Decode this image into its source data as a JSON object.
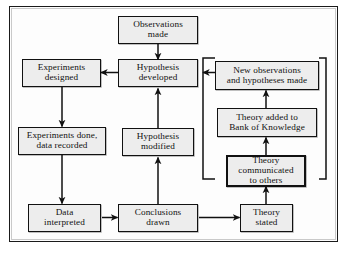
{
  "diagram": {
    "frame_border_color": "#1a1a1a",
    "node_fill_color": "#ededed",
    "node_border_color": "#111111",
    "background_color": "#ffffff",
    "nodes": [
      {
        "id": "observations-made",
        "label": "Observations\nmade",
        "line1": "Observations",
        "line2": "made",
        "line3": ""
      },
      {
        "id": "hypothesis-developed",
        "label": "Hypothesis\ndeveloped",
        "line1": "Hypothesis",
        "line2": "developed",
        "line3": ""
      },
      {
        "id": "experiments-designed",
        "label": "Experiments\ndesigned",
        "line1": "Experiments",
        "line2": "designed",
        "line3": ""
      },
      {
        "id": "experiments-done",
        "label": "Experiments done,\ndata recorded",
        "line1": "Experiments done,",
        "line2": "data recorded",
        "line3": ""
      },
      {
        "id": "hypothesis-modified",
        "label": "Hypothesis\nmodified",
        "line1": "Hypothesis",
        "line2": "modified",
        "line3": ""
      },
      {
        "id": "data-interpreted",
        "label": "Data\ninterpreted",
        "line1": "Data",
        "line2": "interpreted",
        "line3": ""
      },
      {
        "id": "conclusions-drawn",
        "label": "Conclusions\ndrawn",
        "line1": "Conclusions",
        "line2": "drawn",
        "line3": ""
      },
      {
        "id": "theory-stated",
        "label": "Theory\nstated",
        "line1": "Theory",
        "line2": "stated",
        "line3": ""
      },
      {
        "id": "theory-communicated",
        "label": "Theory\ncommunicated\nto others",
        "line1": "Theory",
        "line2": "communicated",
        "line3": "to others"
      },
      {
        "id": "theory-added",
        "label": "Theory added to\nBank of Knowledge",
        "line1": "Theory added to",
        "line2": "Bank of Knowledge",
        "line3": ""
      },
      {
        "id": "new-observations",
        "label": "New observations\nand hypotheses made",
        "line1": "New observations",
        "line2": "and hypotheses made",
        "line3": ""
      }
    ],
    "edges": [
      {
        "from": "observations-made",
        "to": "hypothesis-developed"
      },
      {
        "from": "hypothesis-developed",
        "to": "experiments-designed"
      },
      {
        "from": "experiments-designed",
        "to": "experiments-done"
      },
      {
        "from": "experiments-done",
        "to": "data-interpreted"
      },
      {
        "from": "data-interpreted",
        "to": "conclusions-drawn"
      },
      {
        "from": "conclusions-drawn",
        "to": "hypothesis-modified"
      },
      {
        "from": "hypothesis-modified",
        "to": "hypothesis-developed"
      },
      {
        "from": "conclusions-drawn",
        "to": "theory-stated"
      },
      {
        "from": "theory-stated",
        "to": "theory-communicated"
      },
      {
        "from": "theory-communicated",
        "to": "theory-added"
      },
      {
        "from": "theory-added",
        "to": "new-observations"
      },
      {
        "from": "new-observations",
        "to": "hypothesis-developed"
      }
    ]
  }
}
